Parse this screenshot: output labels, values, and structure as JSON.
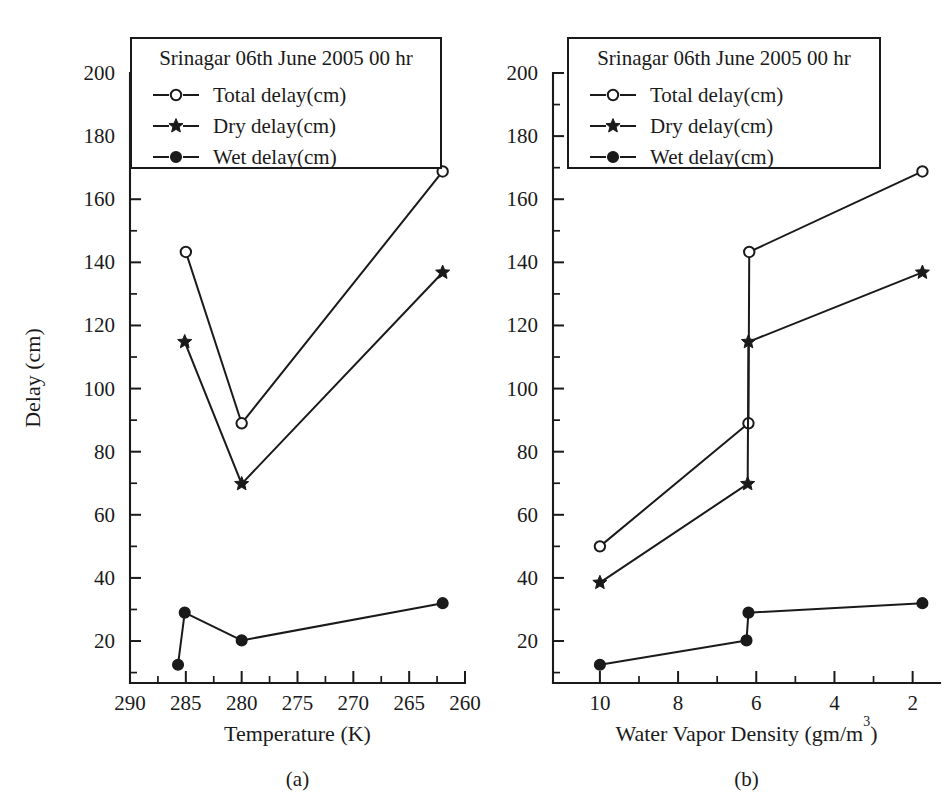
{
  "figure": {
    "background": "#ffffff",
    "ink_color": "#1a1a1a"
  },
  "chart_data": [
    {
      "type": "line",
      "panel_label": "(a)",
      "title": "Srinagar 06th June 2005 00 hr",
      "xlabel": "Temperature (K)",
      "ylabel": "Delay (cm)",
      "xlim": [
        290,
        260
      ],
      "ylim": [
        6.7,
        200
      ],
      "x_reversed": true,
      "xticks": [
        290,
        285,
        280,
        275,
        270,
        265,
        260
      ],
      "xticklabels": [
        "290",
        "285",
        "280",
        "275",
        "270",
        "265",
        "260"
      ],
      "x_minor_step": 2.5,
      "yticks": [
        20,
        40,
        60,
        80,
        100,
        120,
        140,
        160,
        180,
        200
      ],
      "yticklabels": [
        "20",
        "40",
        "60",
        "80",
        "100",
        "120",
        "140",
        "160",
        "180",
        "200"
      ],
      "y_minor_step": 10,
      "grid": false,
      "legend_position": "upper-left",
      "x": [
        285.0,
        285.1,
        280.0,
        262.0
      ],
      "series": [
        {
          "name": "Total delay(cm)",
          "marker": "open-circle",
          "x": [
            285.0,
            280.0,
            262.0
          ],
          "values": [
            143.3,
            89.0,
            168.8
          ]
        },
        {
          "name": "Dry delay(cm)",
          "marker": "star",
          "x": [
            285.1,
            280.0,
            262.0
          ],
          "values": [
            114.8,
            69.8,
            136.8
          ]
        },
        {
          "name": "Wet delay(cm)",
          "marker": "filled-circle",
          "x": [
            285.7,
            285.1,
            280.0,
            262.0
          ],
          "values": [
            12.5,
            29.0,
            20.2,
            32.0
          ]
        }
      ]
    },
    {
      "type": "line",
      "panel_label": "(b)",
      "title": "Srinagar 06th June 2005 00 hr",
      "xlabel": "Water Vapor Density (gm/m3)",
      "xlabel_base": "Water Vapor Density (gm/m",
      "xlabel_sup": "3",
      "xlabel_tail": ")",
      "ylabel": "Delay (cm)",
      "xlim": [
        11.2,
        1.3
      ],
      "ylim": [
        6.7,
        200
      ],
      "x_reversed": true,
      "xticks": [
        10,
        8,
        6,
        4,
        2
      ],
      "xticklabels": [
        "10",
        "8",
        "6",
        "4",
        "2"
      ],
      "x_minor_step": 1,
      "yticks": [
        20,
        40,
        60,
        80,
        100,
        120,
        140,
        160,
        180,
        200
      ],
      "yticklabels": [
        "20",
        "40",
        "60",
        "80",
        "100",
        "120",
        "140",
        "160",
        "180",
        "200"
      ],
      "y_minor_step": 10,
      "grid": false,
      "legend_position": "upper-left",
      "series": [
        {
          "name": "Total delay(cm)",
          "marker": "open-circle",
          "x": [
            10.0,
            6.2,
            6.18,
            1.75
          ],
          "values": [
            50.0,
            89.0,
            143.3,
            168.8
          ]
        },
        {
          "name": "Dry delay(cm)",
          "marker": "star",
          "x": [
            10.0,
            6.22,
            6.2,
            1.75
          ],
          "values": [
            38.5,
            69.8,
            114.8,
            136.8
          ]
        },
        {
          "name": "Wet delay(cm)",
          "marker": "filled-circle",
          "x": [
            10.0,
            6.25,
            6.2,
            1.75
          ],
          "values": [
            12.5,
            20.2,
            29.0,
            32.0
          ]
        }
      ]
    }
  ],
  "legend": {
    "title": "Srinagar 06th June 2005 00 hr",
    "entries": [
      {
        "label": "Total delay(cm)",
        "marker": "open-circle"
      },
      {
        "label": "Dry delay(cm)",
        "marker": "star"
      },
      {
        "label": "Wet delay(cm)",
        "marker": "filled-circle"
      }
    ]
  }
}
